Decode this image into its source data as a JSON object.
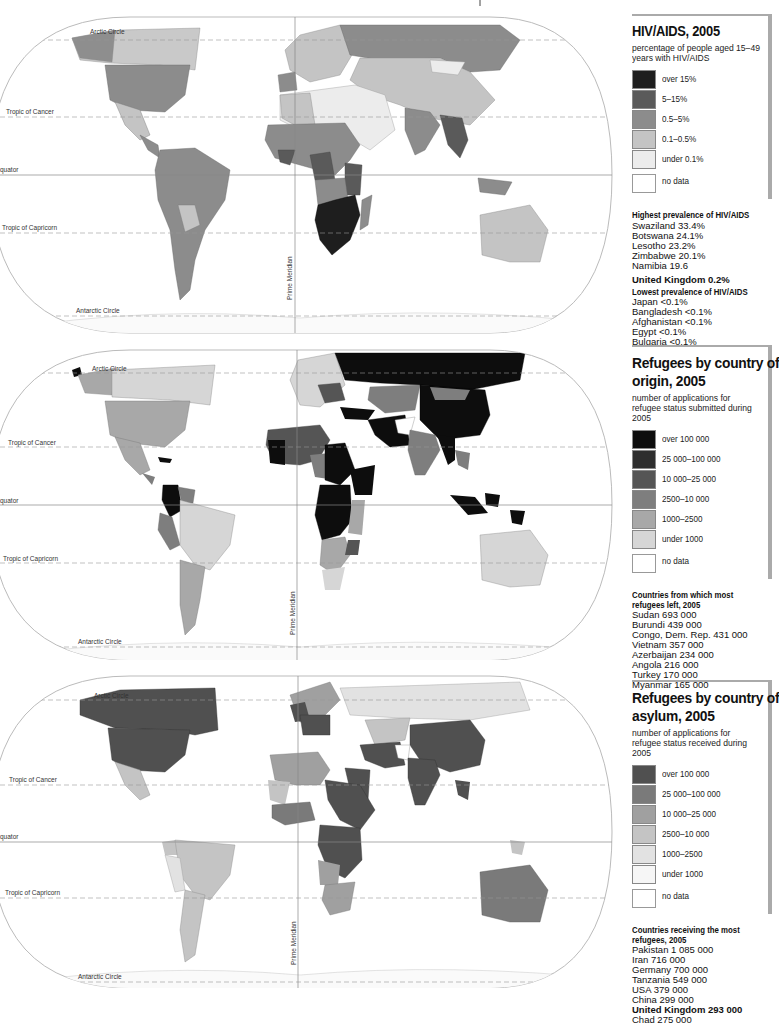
{
  "map_lines": {
    "arctic_circle": "Arctic Circle",
    "tropic_of_cancer": "Tropic of Cancer",
    "equator": "quator",
    "tropic_of_capricorn": "Tropic of Capricorn",
    "antarctic_circle": "Antarctic Circle",
    "prime_meridian": "Prime Meridian"
  },
  "panels": [
    {
      "id": "hiv",
      "title": "HIV/AIDS, 2005",
      "subtitle": "percentage of people aged 15–49 years with HIV/AIDS",
      "legend": [
        {
          "label": "over 15%",
          "color": "#1e1e1e"
        },
        {
          "label": "5–15%",
          "color": "#5a5a5a"
        },
        {
          "label": "0.5–5%",
          "color": "#8c8c8c"
        },
        {
          "label": "0.1–0.5%",
          "color": "#c4c4c4"
        },
        {
          "label": "under 0.1%",
          "color": "#ececec"
        },
        {
          "label": "no data",
          "color": "#ffffff"
        }
      ],
      "stats": {
        "highest_header": "Highest prevalence of HIV/AIDS",
        "highest": [
          "Swaziland 33.4%",
          "Botswana 24.1%",
          "Lesotho 23.2%",
          "Zimbabwe 20.1%",
          "Namibia 19.6"
        ],
        "uk": "United Kingdom 0.2%",
        "lowest_header": "Lowest prevalence of HIV/AIDS",
        "lowest": [
          "Japan <0.1%",
          "Bangladesh <0.1%",
          "Afghanistan <0.1%",
          "Egypt <0.1%",
          "Bulgaria <0.1%"
        ]
      }
    },
    {
      "id": "origin",
      "title": "Refugees by country of origin, 2005",
      "title_line1": "Refugees by country of",
      "title_line2": "origin, 2005",
      "subtitle": "number of applications for refugee status submitted during 2005",
      "legend": [
        {
          "label": "over 100 000",
          "color": "#0d0d0d"
        },
        {
          "label": "25 000–100 000",
          "color": "#2e2e2e"
        },
        {
          "label": "10 000–25 000",
          "color": "#555555"
        },
        {
          "label": "2500–10 000",
          "color": "#7e7e7e"
        },
        {
          "label": "1000–2500",
          "color": "#a8a8a8"
        },
        {
          "label": "under 1000",
          "color": "#d6d6d6"
        },
        {
          "label": "no data",
          "color": "#ffffff"
        }
      ],
      "stats": {
        "header": "Countries from which most refugees left, 2005",
        "rows": [
          "Sudan 693 000",
          "Burundi 439 000",
          "Congo, Dem. Rep. 431 000",
          "Vietnam 357 000",
          "Azerbaijan 234 000",
          "Angola 216 000",
          "Turkey 170 000",
          "Myanmar 165 000"
        ]
      }
    },
    {
      "id": "asylum",
      "title": "Refugees by country of asylum, 2005",
      "title_line1": "Refugees by country of",
      "title_line2": "asylum, 2005",
      "subtitle": "number of applications for refugee status received during 2005",
      "legend": [
        {
          "label": "over 100 000",
          "color": "#505050"
        },
        {
          "label": "25 000–100 000",
          "color": "#7a7a7a"
        },
        {
          "label": "10 000–25 000",
          "color": "#a0a0a0"
        },
        {
          "label": "2500–10 000",
          "color": "#c4c4c4"
        },
        {
          "label": "1000–2500",
          "color": "#e2e2e2"
        },
        {
          "label": "under 1000",
          "color": "#f6f6f6"
        },
        {
          "label": "no data",
          "color": "#ffffff"
        }
      ],
      "stats": {
        "header": "Countries receiving the most refugees, 2005",
        "rows": [
          "Pakistan 1 085 000",
          "Iran 716 000",
          "Germany 700 000",
          "Tanzania 549 000",
          "USA 379 000",
          "China 299 000"
        ],
        "uk": "United Kingdom 293 000",
        "rows_after": [
          "Chad 275 000"
        ]
      }
    }
  ]
}
